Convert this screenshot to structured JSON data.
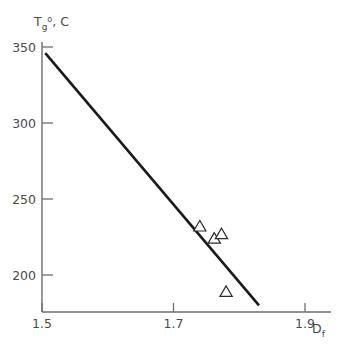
{
  "chart_data": {
    "type": "scatter",
    "title": "",
    "subtitle": "",
    "ylabel_main": "T",
    "ylabel_sub": "g",
    "ylabel_sup": "o",
    "ylabel_rest": ", C",
    "ylabel_full": "Tg o, C",
    "xlabel_main": "D",
    "xlabel_sub": "f",
    "xlabel_full": "Df",
    "xlim": [
      1.5,
      1.9
    ],
    "ylim": [
      180,
      355
    ],
    "xticks": [
      "1.5",
      "1.7",
      "1.9"
    ],
    "xtick_values": [
      1.5,
      1.7,
      1.9
    ],
    "yticks": [
      "200",
      "250",
      "300",
      "350"
    ],
    "ytick_values": [
      200,
      250,
      300,
      350
    ],
    "grid": false,
    "legend": "none",
    "marker": "open-triangle",
    "points": [
      {
        "x": 1.74,
        "y": 232
      },
      {
        "x": 1.762,
        "y": 224
      },
      {
        "x": 1.773,
        "y": 227
      },
      {
        "x": 1.78,
        "y": 189
      }
    ],
    "trendline": {
      "x": [
        1.505,
        1.83
      ],
      "y": [
        346,
        180
      ]
    },
    "colors": {
      "axis": "#6e6e6e",
      "line": "#1a1a1a",
      "marker_stroke": "#2b2b2b",
      "text": "#4a4a4a",
      "background": "#ffffff"
    }
  }
}
